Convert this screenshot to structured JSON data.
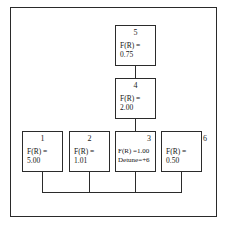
{
  "figure": {
    "frame_color": "#2a2a2a",
    "background": "#ffffff",
    "line_color": "#2b2b2b"
  },
  "operators": [
    {
      "id": "op5",
      "index": "5",
      "index_align": "center",
      "index_outside": false,
      "line1": "F(R) =",
      "line2": "0.75",
      "text_align": "left",
      "x": 115,
      "y": 25,
      "w": 41,
      "h": 41
    },
    {
      "id": "op4",
      "index": "4",
      "index_align": "center",
      "index_outside": false,
      "line1": "F(R) =",
      "line2": "2.00",
      "text_align": "left",
      "x": 115,
      "y": 78,
      "w": 41,
      "h": 41
    },
    {
      "id": "op1",
      "index": "1",
      "index_align": "center",
      "index_outside": false,
      "line1": "F(R) =",
      "line2": "5.00",
      "text_align": "left",
      "x": 22,
      "y": 131,
      "w": 41,
      "h": 41
    },
    {
      "id": "op2",
      "index": "2",
      "index_align": "center",
      "index_outside": false,
      "line1": "F(R) =",
      "line2": "1.01",
      "text_align": "left",
      "x": 69,
      "y": 131,
      "w": 41,
      "h": 41
    },
    {
      "id": "op3",
      "index": "3",
      "index_align": "right",
      "index_outside": false,
      "line1": "F(R) =1.00",
      "line2": "Detune=+6",
      "text_align": "left",
      "x": 115,
      "y": 131,
      "w": 41,
      "h": 41
    },
    {
      "id": "op6",
      "index": "6",
      "index_align": "right",
      "index_outside": true,
      "line1": "F(R) =",
      "line2": "0.50",
      "text_align": "left",
      "x": 161,
      "y": 131,
      "w": 41,
      "h": 41
    }
  ],
  "connections": [
    {
      "id": "conn-5-to-4",
      "from": "op5",
      "to": "op4",
      "kind": "vertical"
    },
    {
      "id": "conn-4-to-3",
      "from": "op4",
      "to": "op3",
      "kind": "vertical"
    },
    {
      "id": "bus-output",
      "from": "op1,op2,op3,op6",
      "to": "output-bus",
      "kind": "bus"
    }
  ]
}
